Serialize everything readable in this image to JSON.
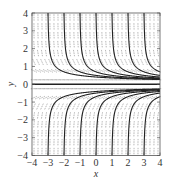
{
  "chart_data": {
    "type": "slope-field",
    "title": "",
    "xlabel": "x",
    "ylabel": "y",
    "xlim": [
      -4,
      4
    ],
    "ylim": [
      -4,
      4
    ],
    "x_ticks": [
      -4,
      -3,
      -2,
      -1,
      0,
      1,
      2,
      3,
      4
    ],
    "y_ticks": [
      -4,
      -3,
      -2,
      -1,
      0,
      1,
      2,
      3,
      4
    ],
    "x_tick_labels": [
      "−4",
      "−3",
      "−2",
      "−1",
      "0",
      "1",
      "2",
      "3",
      "4"
    ],
    "y_tick_labels": [
      "−4",
      "−3",
      "−2",
      "−1",
      "0",
      "1",
      "2",
      "3",
      "4"
    ],
    "grid": false,
    "legend": null,
    "differential_equation_shape": "slopes negative for y>0, positive for y<0, zero on y=0; steep away from y=0",
    "slope_marks": {
      "x_step": 0.25,
      "y_step": 0.5,
      "color": "#9a9a9a",
      "style": "dashed"
    },
    "solution_curves": {
      "color": "#222222",
      "equilibrium": {
        "y": 0
      },
      "upper_branch": {
        "description": "descending from y=4 toward y=0",
        "crosses_top_at_x": [
          -3,
          -2,
          -1,
          0,
          1,
          2,
          3
        ]
      },
      "lower_branch": {
        "description": "rising from y=-4 toward y=0",
        "crosses_bottom_at_x": [
          -3,
          -2,
          -1,
          0,
          1,
          2,
          3
        ]
      }
    }
  },
  "colors": {
    "frame": "#555555",
    "curve": "#222222",
    "slope": "#9a9a9a",
    "text": "#333333"
  }
}
